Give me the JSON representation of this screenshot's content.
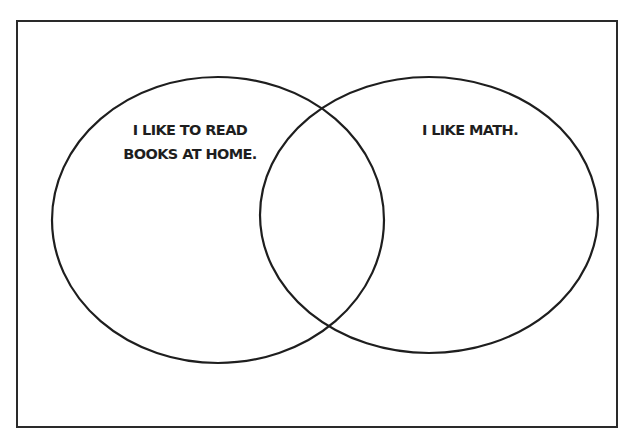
{
  "diagram": {
    "type": "venn",
    "sets": [
      {
        "id": "left",
        "label_lines": [
          "I LIKE TO READ",
          "BOOKS AT HOME."
        ]
      },
      {
        "id": "right",
        "label_lines": [
          "I LIKE MATH."
        ]
      }
    ],
    "colors": {
      "stroke": "#1e1e1e",
      "frame": "#2a2a2a",
      "background": "#ffffff"
    }
  }
}
